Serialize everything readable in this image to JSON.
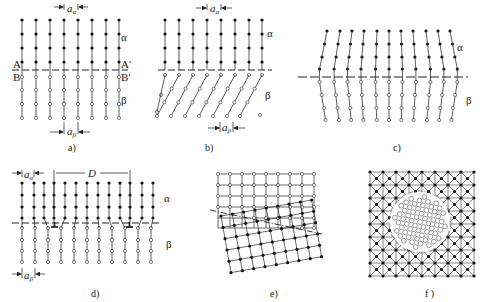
{
  "panels": [
    {
      "id": "a",
      "caption": "a)",
      "phase_top": "α",
      "phase_bottom": "β",
      "spacing_top": "a",
      "spacing_top_sub": "α",
      "spacing_bottom": "a",
      "spacing_bottom_sub": "β",
      "left_labels": [
        "A",
        "B"
      ],
      "right_labels": [
        "A′",
        "B′"
      ],
      "description": "coherent interface"
    },
    {
      "id": "b",
      "caption": "b)",
      "phase_top": "α",
      "phase_bottom": "β",
      "spacing_top": "a",
      "spacing_top_sub": "α",
      "spacing_bottom": "a",
      "spacing_bottom_sub": "β",
      "description": "coherent interface with shear"
    },
    {
      "id": "c",
      "caption": "c)",
      "phase_top": "α",
      "phase_bottom": "β",
      "description": "coherent interface with elastic strain"
    },
    {
      "id": "d",
      "caption": "d)",
      "phase_top": "α",
      "phase_bottom": "β",
      "spacing_top": "a",
      "spacing_top_sub": "α",
      "spacing_bottom": "a",
      "spacing_bottom_sub": "β",
      "dislocation_spacing": "D",
      "description": "semi-coherent interface"
    },
    {
      "id": "e",
      "caption": "e)",
      "description": "incoherent interface"
    },
    {
      "id": "f",
      "caption": "f )",
      "description": "incoherent inclusion"
    }
  ]
}
